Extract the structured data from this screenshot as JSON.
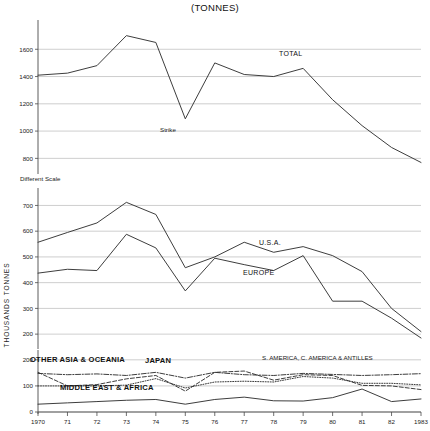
{
  "chart_data": {
    "type": "line",
    "title": "(TONNES)",
    "ylabel": "THOUSANDS TONNES",
    "xlabel": "",
    "note": "Different Scale",
    "x": [
      1970,
      1971,
      1972,
      1973,
      1974,
      1975,
      1976,
      1977,
      1978,
      1979,
      1980,
      1981,
      1982,
      1983
    ],
    "tick_labels": [
      "1970",
      "71",
      "72",
      "73",
      "74",
      "75",
      "76",
      "77",
      "78",
      "79",
      "80",
      "81",
      "82",
      "1983"
    ],
    "panels": [
      {
        "name": "total",
        "ylim": [
          700,
          1800
        ],
        "yticks": [
          800,
          1000,
          1200,
          1400,
          1600
        ],
        "grid": true,
        "series": [
          {
            "name": "TOTAL",
            "label": "TOTAL",
            "style": "solid",
            "values": [
              1410,
              1425,
              1480,
              1700,
              1650,
              1090,
              1500,
              1415,
              1400,
              1460,
              1230,
              1040,
              880,
              770
            ],
            "annotations": [
              {
                "text": "Strike",
                "x": 1975,
                "value": 1090
              }
            ]
          }
        ]
      },
      {
        "name": "usa-europe",
        "ylim": [
          150,
          760
        ],
        "yticks": [
          200,
          300,
          400,
          500,
          600,
          700
        ],
        "grid": true,
        "series": [
          {
            "name": "U.S.A.",
            "label": "U.S.A.",
            "style": "solid",
            "values": [
              557,
              595,
              632,
              712,
              665,
              458,
              500,
              557,
              518,
              540,
              505,
              443,
              300,
              210
            ]
          },
          {
            "name": "EUROPE",
            "label": "EUROPE",
            "style": "solid",
            "values": [
              437,
              452,
              447,
              588,
              535,
              368,
              495,
              470,
              447,
              505,
              328,
              328,
              262,
              185
            ]
          }
        ]
      },
      {
        "name": "regions",
        "ylim": [
          0,
          230
        ],
        "yticks": [
          0,
          100,
          200
        ],
        "grid": true,
        "series": [
          {
            "name": "OTHER ASIA & OCEANIA",
            "label": "OTHER ASIA & OCEANIA",
            "style": "dash-dot",
            "values": [
              148,
              143,
              146,
              140,
              152,
              130,
              152,
              143,
              140,
              148,
              144,
              140,
              143,
              147
            ]
          },
          {
            "name": "JAPAN",
            "label": "JAPAN",
            "style": "dashed",
            "values": [
              152,
              100,
              105,
              127,
              140,
              80,
              152,
              157,
              122,
              143,
              140,
              102,
              100,
              86
            ]
          },
          {
            "name": "S. AMERICA, C. AMERICA & ANTILLES",
            "label": "S. AMERICA, C. AMERICA & ANTILLES",
            "style": "dotted",
            "values": [
              100,
              100,
              100,
              103,
              128,
              92,
              115,
              118,
              115,
              136,
              130,
              110,
              110,
              104
            ]
          },
          {
            "name": "MIDDLE EAST & AFRICA",
            "label": "MIDDLE EAST & AFRICA",
            "style": "solid",
            "values": [
              30,
              35,
              40,
              45,
              48,
              30,
              48,
              57,
              43,
              42,
              55,
              88,
              40,
              50
            ]
          }
        ]
      }
    ]
  }
}
